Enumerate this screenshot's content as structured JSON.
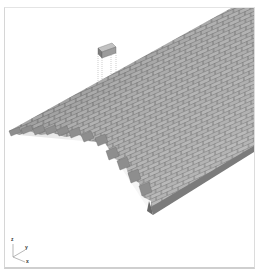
{
  "viewport": {
    "title": "",
    "background": "#ffffff",
    "border_color": "#d4d4d4"
  },
  "model": {
    "description": "3D brick barrel vault (herringbone-like staggered bond)",
    "brick_top_color": "#b8b8b8",
    "brick_side_color": "#8c8c8c",
    "brick_dark_color": "#6f6f6f",
    "mortar_color": "#7a7a7a",
    "floating_brick": {
      "label": "",
      "color": "#9a9a9a"
    }
  },
  "triad": {
    "x_label": "x",
    "y_label": "y",
    "z_label": "z"
  }
}
